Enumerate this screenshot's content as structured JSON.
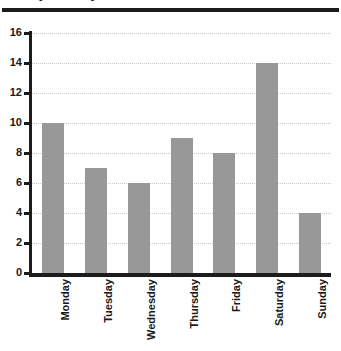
{
  "header": {
    "title_remnant": "Daily Activity",
    "rule_color": "#1c1c1c"
  },
  "colors": {
    "bar_fill": "#989898",
    "axis": "#1c1c1c",
    "gridline": "#c9c9c9",
    "background": "#ffffff",
    "text": "#1a1a1a"
  },
  "chart_data": {
    "type": "bar",
    "title": "",
    "xlabel": "",
    "ylabel": "",
    "categories": [
      "Monday",
      "Tuesday",
      "Wednesday",
      "Thursday",
      "Friday",
      "Saturday",
      "Sunday"
    ],
    "values": [
      10,
      7,
      6,
      9,
      8,
      14,
      4
    ],
    "ylim": [
      0,
      16
    ],
    "ytick_labels": [
      "0",
      "2",
      "4",
      "6",
      "8",
      "10",
      "12",
      "14",
      "16"
    ],
    "ytick_values": [
      0,
      2,
      4,
      6,
      8,
      10,
      12,
      14,
      16
    ],
    "grid": true,
    "grid_axis": "y",
    "grid_style": "dotted",
    "legend": false,
    "xtick_rotation": 90,
    "bar_color": "#989898"
  }
}
